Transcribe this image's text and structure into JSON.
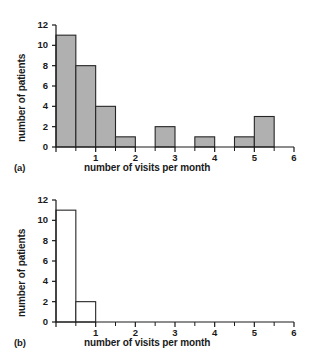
{
  "figure": {
    "background_color": "#ffffff",
    "axis_color": "#1a1a1a",
    "bar_fill_a": "#b0b0b0",
    "bar_fill_b": "#ffffff",
    "bar_stroke": "#262626"
  },
  "panels": [
    {
      "tag": "(a)",
      "xlabel": "number of visits per month",
      "ylabel": "number of patients",
      "ytick_labels": [
        "0",
        "2",
        "4",
        "6",
        "8",
        "10",
        "12"
      ],
      "xtick_labels": [
        "1",
        "2",
        "3",
        "4",
        "5",
        "6"
      ]
    },
    {
      "tag": "(b)",
      "xlabel": "number of visits per month",
      "ylabel": "number of patients",
      "ytick_labels": [
        "0",
        "2",
        "4",
        "6",
        "8",
        "10",
        "12"
      ],
      "xtick_labels": [
        "1",
        "2",
        "3",
        "4",
        "5",
        "6"
      ]
    }
  ],
  "chart_data": [
    {
      "type": "bar",
      "title": "",
      "panel": "(a)",
      "xlabel": "number of visits per month",
      "ylabel": "number of patients",
      "xlim": [
        0,
        6
      ],
      "ylim": [
        0,
        12
      ],
      "bin_width": 0.5,
      "grid": false,
      "legend": "none",
      "filled": true,
      "fill_color": "#b0b0b0",
      "xticks": [
        0,
        1,
        2,
        3,
        4,
        5,
        6
      ],
      "xtick_labels": [
        "",
        "1",
        "2",
        "3",
        "4",
        "5",
        "6"
      ],
      "yticks": [
        0,
        2,
        4,
        6,
        8,
        10,
        12
      ],
      "ytick_labels": [
        "0",
        "2",
        "4",
        "6",
        "8",
        "10",
        "12"
      ],
      "minor_xticks": [
        0.5,
        1.5,
        2.5,
        3.5,
        4.5,
        5.5
      ],
      "bins": [
        {
          "x0": 0.0,
          "x1": 0.5,
          "value": 11
        },
        {
          "x0": 0.5,
          "x1": 1.0,
          "value": 8
        },
        {
          "x0": 1.0,
          "x1": 1.5,
          "value": 4
        },
        {
          "x0": 1.5,
          "x1": 2.0,
          "value": 1
        },
        {
          "x0": 2.0,
          "x1": 2.5,
          "value": 0
        },
        {
          "x0": 2.5,
          "x1": 3.0,
          "value": 2
        },
        {
          "x0": 3.0,
          "x1": 3.5,
          "value": 0
        },
        {
          "x0": 3.5,
          "x1": 4.0,
          "value": 1
        },
        {
          "x0": 4.0,
          "x1": 4.5,
          "value": 0
        },
        {
          "x0": 4.5,
          "x1": 5.0,
          "value": 1
        },
        {
          "x0": 5.0,
          "x1": 5.5,
          "value": 3
        },
        {
          "x0": 5.5,
          "x1": 6.0,
          "value": 0
        }
      ],
      "categories": [
        "0-0.5",
        "0.5-1",
        "1-1.5",
        "1.5-2",
        "2-2.5",
        "2.5-3",
        "3-3.5",
        "3.5-4",
        "4-4.5",
        "4.5-5",
        "5-5.5",
        "5.5-6"
      ],
      "values": [
        11,
        8,
        4,
        1,
        0,
        2,
        0,
        1,
        0,
        1,
        3,
        0
      ]
    },
    {
      "type": "bar",
      "title": "",
      "panel": "(b)",
      "xlabel": "number of visits per month",
      "ylabel": "number of patients",
      "xlim": [
        0,
        6
      ],
      "ylim": [
        0,
        12
      ],
      "bin_width": 0.5,
      "grid": false,
      "legend": "none",
      "filled": false,
      "fill_color": "#ffffff",
      "xticks": [
        0,
        1,
        2,
        3,
        4,
        5,
        6
      ],
      "xtick_labels": [
        "",
        "1",
        "2",
        "3",
        "4",
        "5",
        "6"
      ],
      "yticks": [
        0,
        2,
        4,
        6,
        8,
        10,
        12
      ],
      "ytick_labels": [
        "0",
        "2",
        "4",
        "6",
        "8",
        "10",
        "12"
      ],
      "minor_xticks": [
        0.5,
        1.5,
        2.5,
        3.5,
        4.5,
        5.5
      ],
      "bins": [
        {
          "x0": 0.0,
          "x1": 0.5,
          "value": 11
        },
        {
          "x0": 0.5,
          "x1": 1.0,
          "value": 2
        },
        {
          "x0": 1.0,
          "x1": 1.5,
          "value": 0
        },
        {
          "x0": 1.5,
          "x1": 2.0,
          "value": 0
        },
        {
          "x0": 2.0,
          "x1": 2.5,
          "value": 0
        },
        {
          "x0": 2.5,
          "x1": 3.0,
          "value": 0
        },
        {
          "x0": 3.0,
          "x1": 3.5,
          "value": 0
        },
        {
          "x0": 3.5,
          "x1": 4.0,
          "value": 0
        },
        {
          "x0": 4.0,
          "x1": 4.5,
          "value": 0
        },
        {
          "x0": 4.5,
          "x1": 5.0,
          "value": 0
        },
        {
          "x0": 5.0,
          "x1": 5.5,
          "value": 0
        },
        {
          "x0": 5.5,
          "x1": 6.0,
          "value": 0
        }
      ],
      "categories": [
        "0-0.5",
        "0.5-1",
        "1-1.5",
        "1.5-2",
        "2-2.5",
        "2.5-3",
        "3-3.5",
        "3.5-4",
        "4-4.5",
        "4.5-5",
        "5-5.5",
        "5.5-6"
      ],
      "values": [
        11,
        2,
        0,
        0,
        0,
        0,
        0,
        0,
        0,
        0,
        0,
        0
      ]
    }
  ]
}
